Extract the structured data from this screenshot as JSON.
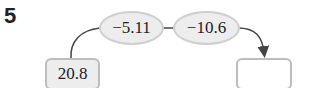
{
  "problem": {
    "number": "5",
    "start_value": "20.8",
    "operations": [
      "−5.11",
      "−10.6"
    ],
    "result_value": ""
  },
  "colors": {
    "oval_fill": "#ededed",
    "oval_border": "#cfcfcf",
    "box_border": "#bdbdbd",
    "arrow": "#444444"
  }
}
